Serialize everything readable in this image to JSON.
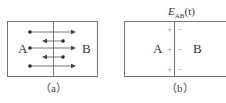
{
  "figure": {
    "panel_a": {
      "caption": "（a）",
      "left_label": "A",
      "right_label": "B",
      "arrows": [
        {
          "direction": "right",
          "y": 32
        },
        {
          "direction": "left",
          "y": 41
        },
        {
          "direction": "right",
          "y": 48
        },
        {
          "direction": "left",
          "y": 57
        },
        {
          "direction": "right",
          "y": 66
        }
      ]
    },
    "panel_b": {
      "title_main": "E",
      "title_sub": "AB",
      "title_arg": "(t)",
      "caption": "（b）",
      "left_label": "A",
      "right_label": "B",
      "plus_signs": [
        "+",
        "+",
        "+"
      ],
      "minus_signs": [
        "−",
        "−",
        "−"
      ]
    }
  }
}
